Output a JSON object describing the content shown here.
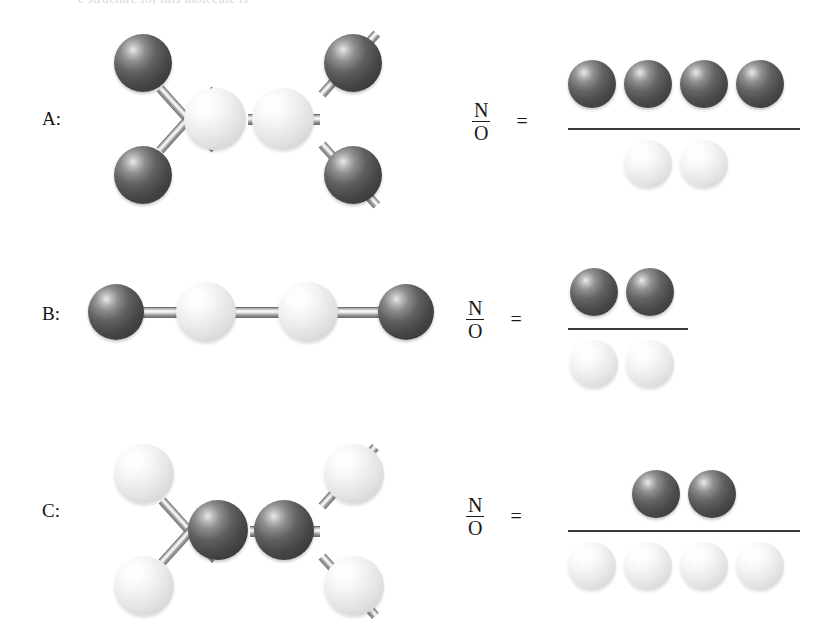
{
  "figure": {
    "type": "molecular-ratio-diagram",
    "cropped_header_text": "e structure for this molecule is",
    "legend": {
      "dark_sphere_meaning": "N",
      "light_sphere_meaning": "O"
    },
    "colors": {
      "dark_atom": "#4a4a4a",
      "light_atom": "#e8e8e8",
      "bond": "#c9c9c9",
      "rule": "#3a3a3a",
      "text": "#1a1a1a",
      "background": "#ffffff"
    }
  },
  "rows": [
    {
      "label": "A:",
      "ratio": {
        "numerator_symbol": "N",
        "denominator_symbol": "O",
        "equals": "=",
        "numerator_count": 4,
        "denominator_count": 2,
        "numerator_color": "dark",
        "denominator_color": "light",
        "value": "4/2"
      },
      "molecule": {
        "description": "Two light central atoms joined by a double bond, each bearing two dark terminal atoms",
        "geometry": "ethylene-like planar",
        "central_atoms": 2,
        "central_color": "light",
        "terminal_atoms": 4,
        "terminal_color": "dark",
        "central_bond": "double"
      }
    },
    {
      "label": "B:",
      "ratio": {
        "numerator_symbol": "N",
        "denominator_symbol": "O",
        "equals": "=",
        "numerator_count": 2,
        "denominator_count": 2,
        "numerator_color": "dark",
        "denominator_color": "light",
        "value": "2/2"
      },
      "molecule": {
        "description": "Linear chain: dark, light, light, dark",
        "geometry": "linear chain",
        "central_atoms": 2,
        "central_color": "light",
        "terminal_atoms": 2,
        "terminal_color": "dark",
        "central_bond": "double"
      }
    },
    {
      "label": "C:",
      "ratio": {
        "numerator_symbol": "N",
        "denominator_symbol": "O",
        "equals": "=",
        "numerator_count": 2,
        "denominator_count": 4,
        "numerator_color": "dark",
        "denominator_color": "light",
        "value": "2/4"
      },
      "molecule": {
        "description": "Two dark central atoms joined by a double bond, each bearing two light terminal atoms",
        "geometry": "ethylene-like planar",
        "central_atoms": 2,
        "central_color": "dark",
        "terminal_atoms": 4,
        "terminal_color": "light",
        "central_bond": "double"
      }
    }
  ]
}
